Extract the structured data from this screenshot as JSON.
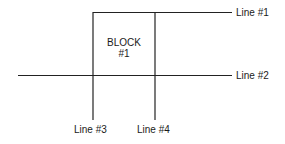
{
  "diagram": {
    "block": {
      "line1": "BLOCK",
      "line2": "#1"
    },
    "lines": [
      {
        "id": "line-1",
        "label": "Line #1",
        "orientation": "horizontal"
      },
      {
        "id": "line-2",
        "label": "Line #2",
        "orientation": "horizontal"
      },
      {
        "id": "line-3",
        "label": "Line #3",
        "orientation": "vertical"
      },
      {
        "id": "line-4",
        "label": "Line #4",
        "orientation": "vertical"
      }
    ],
    "stroke_color": "#222222"
  }
}
